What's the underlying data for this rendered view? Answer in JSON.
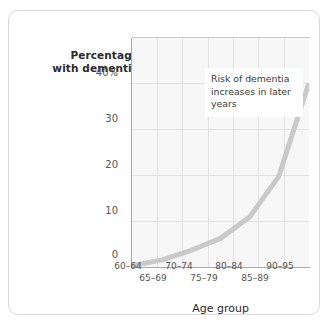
{
  "chart_data": {
    "type": "line",
    "title": "",
    "subtitle": "",
    "xlabel": "Age group",
    "ylabel": "Percentage with dementia",
    "categories": [
      "60–64",
      "65–69",
      "70–74",
      "75–79",
      "80–84",
      "85–89",
      "90–95"
    ],
    "values": [
      0.3,
      1.5,
      3.5,
      6.0,
      10.5,
      19.0,
      38.0
    ],
    "ylim": [
      0,
      48
    ],
    "yticks": [
      0,
      10,
      20,
      30,
      40
    ],
    "ytick_labels": [
      "0",
      "10",
      "20",
      "30",
      "40%"
    ],
    "grid": true,
    "legend": "none",
    "series_color": "#c9c9c9",
    "plot_bg": "#f7f7f7",
    "grid_color": "#e2e2e2",
    "axis_color": "#a9a9a9",
    "annotations": [
      {
        "text": "Risk of dementia increases in later years",
        "lines": [
          "Risk of dementia",
          "increases in later",
          "years"
        ]
      }
    ]
  },
  "axis": {
    "y_title_line1": "Percentage",
    "y_title_line2": "with dementia",
    "x_title": "Age group",
    "y_labels": {
      "t40": "40%",
      "t30": "30",
      "t20": "20",
      "t10": "10",
      "t0": "0"
    },
    "x_labels": {
      "g0": "60–64",
      "g1": "65–69",
      "g2": "70–74",
      "g3": "75–79",
      "g4": "80–84",
      "g5": "85–89",
      "g6": "90–95"
    }
  },
  "annotation": {
    "line1": "Risk of dementia",
    "line2": "increases in later",
    "line3": "years"
  }
}
